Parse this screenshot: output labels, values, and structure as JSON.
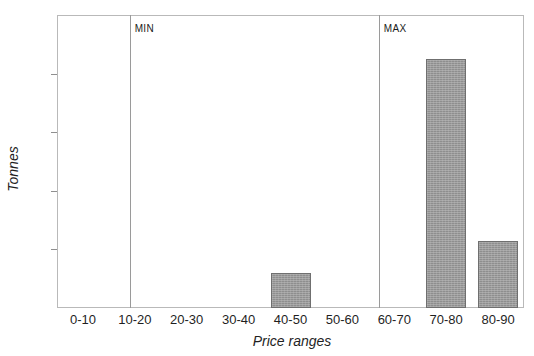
{
  "chart_data": {
    "type": "bar",
    "title": "",
    "xlabel": "Price ranges",
    "ylabel": "Tonnes",
    "categories": [
      "0-10",
      "10-20",
      "20-30",
      "30-40",
      "40-50",
      "50-60",
      "60-70",
      "70-80",
      "80-90"
    ],
    "values": [
      0,
      0,
      0,
      0,
      12,
      0,
      0,
      85,
      23
    ],
    "ylim": [
      0,
      100
    ],
    "yticks": [
      0,
      20,
      40,
      60,
      80,
      100
    ],
    "ytick_labels": [
      "0",
      "20",
      "40",
      "60",
      "80",
      "100"
    ],
    "grid": false,
    "legend": false,
    "bar_color": "#9a9a9a",
    "bar_edge_color": "#6f6f6f",
    "annotations": [
      {
        "label": "MIN",
        "type": "vertical-line",
        "x_position": "10-20/20-30 boundary"
      },
      {
        "label": "MAX",
        "type": "vertical-line",
        "x_position": "60-70 left edge"
      }
    ]
  }
}
